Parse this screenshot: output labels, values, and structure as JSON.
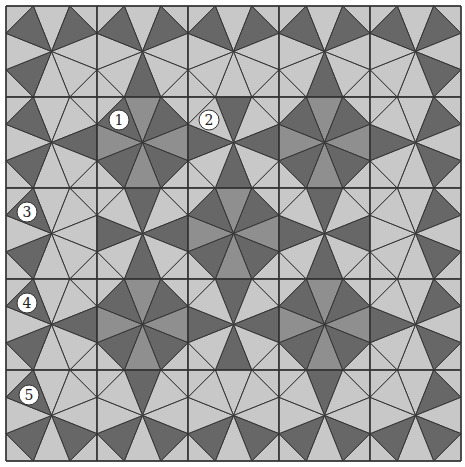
{
  "figure": {
    "origin": [
      6,
      6
    ],
    "cell_size": 91,
    "rows": 5,
    "cols": 5,
    "edge_fractions": [
      0.3,
      0.7
    ],
    "colors": {
      "L": "#c8c8c8",
      "M": "#8f8f8f",
      "D": "#676767",
      "line": "#333333",
      "label_fill": "#ffffff",
      "label_stroke": "#333333"
    },
    "sector_order": [
      "T",
      "TR",
      "R",
      "BR",
      "B",
      "BL",
      "L",
      "TL"
    ],
    "cells": [
      [
        {
          "TL": "D",
          "TR": "D",
          "BL": "D"
        },
        {
          "TL": "D",
          "TR": "D",
          "B": "D"
        },
        {
          "TL": "D",
          "TR": "D"
        },
        {
          "TL": "D",
          "TR": "D",
          "B": "D"
        },
        {
          "TL": "D",
          "TR": "D",
          "BR": "D"
        }
      ],
      [
        {
          "TL": "D",
          "R": "D",
          "BL": "D"
        },
        {
          "TL": "D",
          "T": "M",
          "TR": "D",
          "R": "M",
          "BR": "D",
          "B": "M",
          "BL": "D",
          "L": "M"
        },
        {
          "T": "D",
          "R": "D",
          "B": "D",
          "L": "D"
        },
        {
          "TL": "D",
          "T": "M",
          "TR": "D",
          "R": "M",
          "BR": "D",
          "B": "M",
          "BL": "D",
          "L": "M"
        },
        {
          "L": "D",
          "TR": "D",
          "BR": "D"
        }
      ],
      [
        {
          "TL": "D",
          "BL": "D"
        },
        {
          "T": "D",
          "R": "D",
          "B": "D",
          "L": "D"
        },
        {
          "TL": "D",
          "T": "M",
          "TR": "D",
          "R": "M",
          "BR": "D",
          "B": "M",
          "BL": "D",
          "L": "M"
        },
        {
          "T": "D",
          "R": "D",
          "B": "D",
          "L": "D"
        },
        {
          "TR": "D",
          "BR": "D"
        }
      ],
      [
        {
          "TL": "D",
          "R": "D",
          "BL": "D"
        },
        {
          "TL": "D",
          "T": "M",
          "TR": "D",
          "R": "M",
          "BR": "D",
          "B": "M",
          "BL": "D",
          "L": "M"
        },
        {
          "T": "D",
          "R": "D",
          "B": "D",
          "L": "D"
        },
        {
          "TL": "D",
          "T": "M",
          "TR": "D",
          "R": "M",
          "BR": "D",
          "B": "M",
          "BL": "D",
          "L": "M"
        },
        {
          "L": "D",
          "TR": "D",
          "BR": "D"
        }
      ],
      [
        {
          "TL": "D",
          "BL": "D",
          "BR": "D"
        },
        {
          "T": "D",
          "BL": "D",
          "BR": "D"
        },
        {
          "BL": "D",
          "BR": "D"
        },
        {
          "T": "D",
          "BL": "D",
          "BR": "D"
        },
        {
          "TR": "D",
          "BL": "D",
          "BR": "D"
        }
      ]
    ],
    "labels": [
      {
        "text": "1",
        "x": 119,
        "y": 120
      },
      {
        "text": "2",
        "x": 209,
        "y": 120
      },
      {
        "text": "3",
        "x": 27,
        "y": 212
      },
      {
        "text": "4",
        "x": 27,
        "y": 303
      },
      {
        "text": "5",
        "x": 29,
        "y": 395
      }
    ],
    "label_radius": 10
  }
}
